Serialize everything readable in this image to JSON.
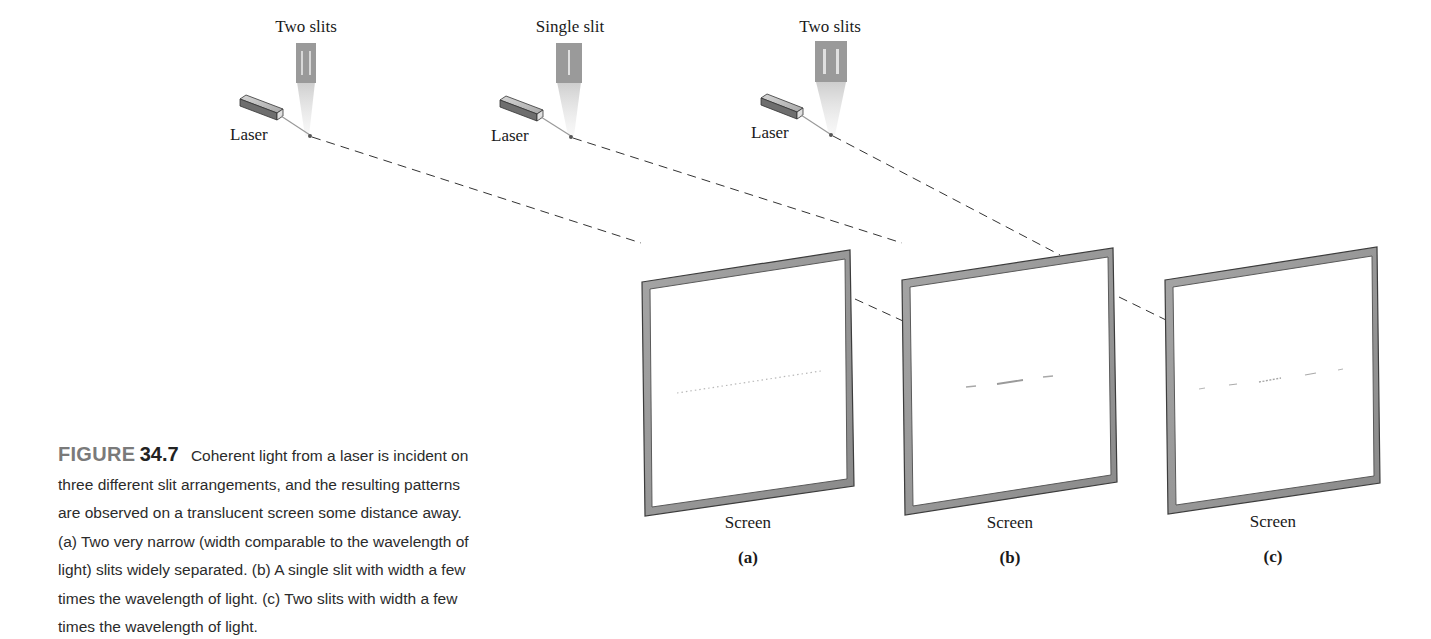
{
  "setups": [
    {
      "id": "a",
      "slit_label": "Two slits",
      "laser_label": "Laser",
      "slit_count": 2
    },
    {
      "id": "b",
      "slit_label": "Single slit",
      "laser_label": "Laser",
      "slit_count": 1
    },
    {
      "id": "c",
      "slit_label": "Two slits",
      "laser_label": "Laser",
      "slit_count": 2
    }
  ],
  "screens": [
    {
      "id": "a",
      "label": "Screen",
      "panel": "(a)",
      "pattern": "fine-dotted-fringes"
    },
    {
      "id": "b",
      "label": "Screen",
      "panel": "(b)",
      "pattern": "single-slit-central-max"
    },
    {
      "id": "c",
      "label": "Screen",
      "panel": "(c)",
      "pattern": "double-slit-with-envelope"
    }
  ],
  "caption": {
    "figure_word": "FIGURE",
    "figure_number": "34.7",
    "text": "Coherent light from a laser is incident on three different slit arrangements, and the resulting patterns are observed on a translucent screen some distance away. (a) Two very narrow (width comparable to the wavelength of light) slits widely separated. (b) A single slit with width a few times the wavelength of light. (c) Two slits with width a few times the wavelength of light."
  },
  "colors": {
    "frame": "#8c8c8c",
    "frame_dark": "#4a4a4a",
    "slit_plate": "#9a9a9a",
    "dash": "#333333",
    "text": "#1a1a1a",
    "caption_figure_word": "#7a7a7a"
  }
}
